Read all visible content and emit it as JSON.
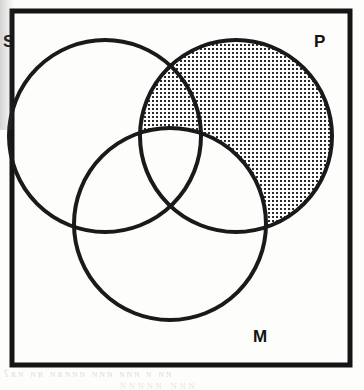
{
  "figure": {
    "name": "three-circle-venn-diagram",
    "kind": "venn",
    "labels": {
      "left": "S",
      "right": "P",
      "bottom": "M"
    },
    "colors": {
      "ink": "#1a1a1a",
      "frame": "#151515",
      "hatch": "#2b2b2b",
      "paper": "#fdfdfc",
      "ghost": "#c9c9c4"
    },
    "frame": {
      "x": 12,
      "y": 11,
      "width": 338,
      "height": 354,
      "stroke_width": 5
    },
    "circles": [
      {
        "id": "S",
        "label": "S",
        "cx": 105,
        "cy": 136,
        "r": 96,
        "stroke_width": 4
      },
      {
        "id": "P",
        "label": "P",
        "cx": 236,
        "cy": 136,
        "r": 96,
        "stroke_width": 4
      },
      {
        "id": "M",
        "label": "M",
        "cx": 170,
        "cy": 224,
        "r": 96,
        "stroke_width": 4
      }
    ],
    "label_positions": [
      {
        "id": "S",
        "x": 3,
        "y": 47
      },
      {
        "id": "P",
        "x": 314,
        "y": 47
      },
      {
        "id": "M",
        "x": 253,
        "y": 342
      }
    ],
    "shaded_regions": [
      {
        "id": "P-minus-M",
        "description": "region inside circle P and outside circle M (shaded with dot hatch)",
        "fill": "hatch-dots"
      }
    ],
    "hatch": {
      "pattern": "dot-grid",
      "spacing": 4,
      "dot_size": 2,
      "color": "#2b2b2b"
    },
    "bleed_through": {
      "line1": "ʕʀɴ ɴʀ ɴʀɴɴɴ ɴɴɴ ɴɴɴ ɴ ɴɴ",
      "line2": "ɴɴɴɴɴ  ɴɴɴ"
    }
  }
}
